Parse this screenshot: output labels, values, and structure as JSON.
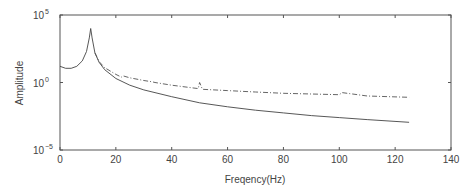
{
  "chart_data": {
    "type": "line",
    "title": "",
    "xlabel": "Freqency(Hz)",
    "ylabel": "Amplitude",
    "xlim": [
      0,
      140
    ],
    "ylim_log10": [
      -5,
      5
    ],
    "yscale": "log",
    "grid": false,
    "legend": null,
    "x_ticks": [
      "0",
      "20",
      "40",
      "60",
      "80",
      "100",
      "120",
      "140"
    ],
    "y_ticks": [
      {
        "base": "10",
        "exp": "5",
        "log": 5
      },
      {
        "base": "10",
        "exp": "0",
        "log": 0
      },
      {
        "base": "10",
        "exp": "−5",
        "log": -5
      }
    ],
    "series": [
      {
        "name": "solid",
        "style": "solid",
        "color": "#444444",
        "x": [
          0,
          2,
          4,
          6,
          8,
          9.5,
          10.5,
          11,
          11.5,
          12.5,
          14,
          16,
          20,
          25,
          30,
          40,
          50,
          60,
          70,
          80,
          90,
          100,
          110,
          125
        ],
        "log10y": [
          1.2,
          1.05,
          1.05,
          1.2,
          1.6,
          2.3,
          3.3,
          4.0,
          3.3,
          2.2,
          1.5,
          0.95,
          0.3,
          -0.2,
          -0.55,
          -1.05,
          -1.5,
          -1.8,
          -2.05,
          -2.25,
          -2.45,
          -2.6,
          -2.75,
          -2.95
        ]
      },
      {
        "name": "dash-dot",
        "style": "dashdot",
        "color": "#555555",
        "x": [
          12.5,
          14,
          16,
          20,
          22,
          22.5,
          25,
          30,
          33,
          34,
          40,
          49.5,
          50,
          51,
          60,
          70,
          80,
          90,
          100,
          101,
          110,
          125
        ],
        "log10y": [
          2.2,
          1.55,
          1.1,
          0.6,
          0.4,
          0.5,
          0.35,
          0.15,
          0.05,
          0.0,
          -0.2,
          -0.45,
          0.0,
          -0.5,
          -0.6,
          -0.7,
          -0.8,
          -0.85,
          -0.9,
          -0.75,
          -1.0,
          -1.1
        ]
      }
    ],
    "annotations": []
  }
}
